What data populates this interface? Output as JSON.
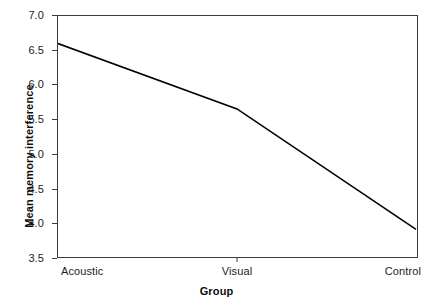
{
  "chart_data": {
    "type": "line",
    "title": "",
    "xlabel": "Group",
    "ylabel": "Mean memory interference",
    "categories": [
      "Acoustic",
      "Visual",
      "Control"
    ],
    "values": [
      6.6,
      5.65,
      3.9
    ],
    "series": [
      {
        "name": "Mean memory interference",
        "values": [
          6.6,
          5.65,
          3.9
        ]
      }
    ],
    "ylim": [
      3.5,
      7.0
    ],
    "ytick_labels": [
      "7.0",
      "6.5",
      "6.0",
      "5.5",
      "5.0",
      "4.5",
      "4.0",
      "3.5"
    ],
    "ytick_values": [
      7.0,
      6.5,
      6.0,
      5.5,
      5.0,
      4.5,
      4.0,
      3.5
    ],
    "xtick_labels": [
      "Acoustic",
      "Visual",
      "Control"
    ],
    "grid": false,
    "legend": false,
    "legend_position": "none",
    "line_color": "#000000",
    "frame_color": "#3a3a3a",
    "background_color": "#ffffff"
  }
}
